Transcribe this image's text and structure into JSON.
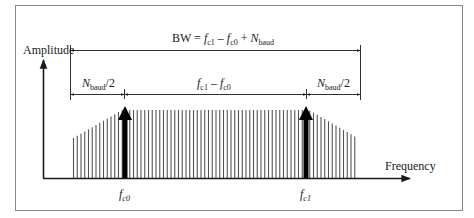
{
  "diagram": {
    "type": "spectrum-bandwidth",
    "y_axis_label": "Amplitude",
    "x_axis_label": "Frequency",
    "bandwidth_formula": {
      "prefix": "BW = ",
      "f": "f",
      "c1_sub": "c1",
      "minus": " – ",
      "c0_sub": "c0",
      "plus": " + ",
      "N": "N",
      "baud_sub": "baud"
    },
    "segments": [
      {
        "id": "left-half-baud",
        "N": "N",
        "sub": "baud",
        "suffix": "/2"
      },
      {
        "id": "carrier-separation",
        "f1": "f",
        "f1_sub": "c1",
        "minus": " – ",
        "f0": "f",
        "f0_sub": "c0"
      },
      {
        "id": "right-half-baud",
        "N": "N",
        "sub": "baud",
        "suffix": "/2"
      }
    ],
    "carriers": [
      {
        "id": "fc0",
        "f": "f",
        "sub": "c0"
      },
      {
        "id": "fc1",
        "f": "f",
        "sub": "c1"
      }
    ],
    "colors": {
      "line": "#1a1a1a",
      "spectral_lines": "#555555",
      "border": "#888888"
    }
  }
}
